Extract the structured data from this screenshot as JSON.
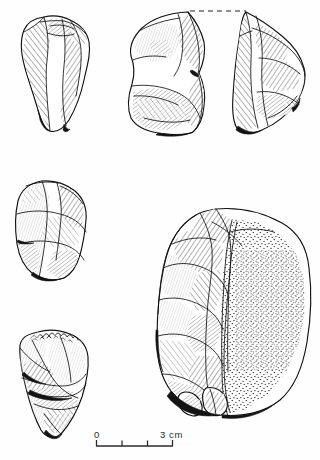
{
  "plate": {
    "kind": "archaeological-lithic-illustration",
    "medium": "pen-and-ink line drawing",
    "background_color": "#fefefe",
    "ink_color": "#111111",
    "figure_count": 5
  },
  "artifacts": [
    {
      "id": "a",
      "label": "top-left-flake",
      "description": "elongated flake with dorsal ridge, hatched shading",
      "position": "top-left",
      "bbox": [
        20,
        16,
        72,
        116
      ],
      "shading": "hatching"
    },
    {
      "id": "b",
      "label": "top-middle-core-fragment",
      "description": "refitting fragment, left half, hatched",
      "position": "top-centre",
      "bbox": [
        128,
        12,
        78,
        124
      ],
      "shading": "hatching"
    },
    {
      "id": "c",
      "label": "top-right-core-fragment",
      "description": "refitting fragment, right half, hatched",
      "position": "top-right",
      "bbox": [
        232,
        12,
        74,
        124
      ],
      "shading": "hatching"
    },
    {
      "id": "d",
      "label": "middle-left-flake",
      "description": "squat flake with multiple removal scars",
      "position": "middle-left",
      "bbox": [
        14,
        180,
        73,
        102
      ],
      "shading": "hatching"
    },
    {
      "id": "e",
      "label": "bottom-left-denticulate",
      "description": "flake with denticulated/serrated upper margin",
      "position": "bottom-left",
      "bbox": [
        17,
        330,
        72,
        108
      ],
      "shading": "hatching"
    },
    {
      "id": "f",
      "label": "large-core-with-cortex",
      "description": "large ovate core, flaked left face, stippled cortex on right",
      "position": "right",
      "bbox": [
        158,
        208,
        152,
        208
      ],
      "shading": "hatching and stipple"
    }
  ],
  "refit_guide": {
    "name": "refit-dashed-line",
    "description": "dashed horizontal line linking the two upper refitting fragments",
    "x1": 190,
    "y1": 11,
    "x2": 246,
    "y2": 11
  },
  "scale_bar": {
    "name": "scale-bar",
    "start_label": "0",
    "end_label": "3 cm",
    "unit": "cm",
    "total_length_cm": 3,
    "tick_values": [
      0,
      1,
      2,
      3
    ],
    "x_start": 96,
    "x_end": 173,
    "baseline_y": 446,
    "tick_height": 6,
    "label_y": 438
  }
}
